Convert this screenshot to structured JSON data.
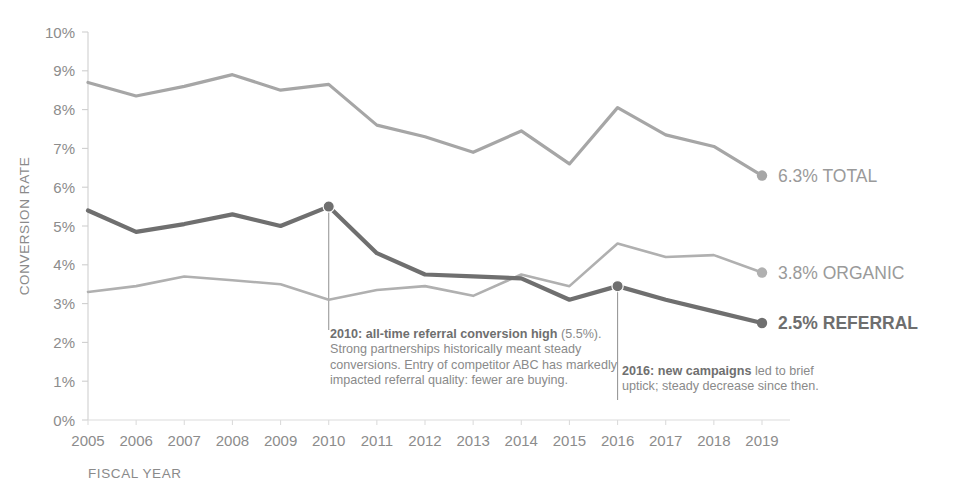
{
  "chart_data": {
    "type": "line",
    "title": "",
    "xlabel": "FISCAL YEAR",
    "ylabel": "CONVERSION RATE",
    "categories": [
      "2005",
      "2006",
      "2007",
      "2008",
      "2009",
      "2010",
      "2011",
      "2012",
      "2013",
      "2014",
      "2015",
      "2016",
      "2017",
      "2018",
      "2019"
    ],
    "ylim": [
      0,
      10
    ],
    "ytick_labels": [
      "0%",
      "1%",
      "2%",
      "3%",
      "4%",
      "5%",
      "6%",
      "7%",
      "8%",
      "9%",
      "10%"
    ],
    "ytick_values": [
      0,
      1,
      2,
      3,
      4,
      5,
      6,
      7,
      8,
      9,
      10
    ],
    "grid": false,
    "legend_position": "right-inline-end-of-line",
    "series": [
      {
        "name": "TOTAL",
        "color": "#a6a6a6",
        "width": 3.2,
        "end_label": "6.3% TOTAL",
        "end_value": "6.3",
        "values": [
          8.7,
          8.35,
          8.6,
          8.9,
          8.5,
          8.65,
          7.6,
          7.3,
          6.9,
          7.45,
          6.6,
          8.05,
          7.35,
          7.05,
          6.3
        ]
      },
      {
        "name": "ORGANIC",
        "color": "#b0b0b0",
        "width": 2.6,
        "end_label": "3.8% ORGANIC",
        "end_value": "3.8",
        "values": [
          3.3,
          3.45,
          3.7,
          3.6,
          3.5,
          3.1,
          3.35,
          3.45,
          3.2,
          3.75,
          3.45,
          4.55,
          4.2,
          4.25,
          3.8
        ]
      },
      {
        "name": "REFERRAL",
        "color": "#6f6f6f",
        "width": 4.2,
        "end_label": "2.5% REFERRAL",
        "end_value": "2.5",
        "values": [
          5.4,
          4.85,
          5.05,
          5.3,
          5.0,
          5.5,
          4.3,
          3.75,
          3.7,
          3.65,
          3.1,
          3.45,
          3.1,
          2.8,
          2.5
        ]
      }
    ],
    "markers": [
      {
        "series": "REFERRAL",
        "category": "2010",
        "value": 5.5
      },
      {
        "series": "REFERRAL",
        "category": "2016",
        "value": 3.45
      }
    ],
    "annotations": [
      {
        "id": "anno-2010",
        "anchor_category": "2010",
        "bold": "2010: all-time referral conversion high",
        "rest": " (5.5%). Strong partnerships historically meant steady conversions. Entry of competitor ABC has markedly impacted referral quality: fewer are buying."
      },
      {
        "id": "anno-2016",
        "anchor_category": "2016",
        "bold": "2016: new campaigns",
        "rest": " led to brief uptick; steady decrease since then."
      }
    ]
  },
  "colors": {
    "total": "#a6a6a6",
    "organic": "#b0b0b0",
    "referral": "#6f6f6f",
    "axis": "#cfcfcf",
    "tick_text": "#8c8c8c",
    "background": "#ffffff"
  }
}
